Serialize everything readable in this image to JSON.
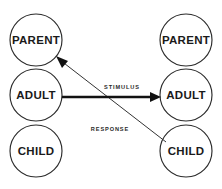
{
  "diagram": {
    "background_color": "#ffffff",
    "line_color": "#111111",
    "circle_stroke_color": "#2b2b2b",
    "text_color": "#1a1a1a",
    "left_column": {
      "name": "left-person",
      "nodes": [
        {
          "id": "left-parent",
          "label": "PARENT",
          "cx": 36,
          "cy": 40,
          "r": 26
        },
        {
          "id": "left-adult",
          "label": "ADULT",
          "cx": 36,
          "cy": 95,
          "r": 26
        },
        {
          "id": "left-child",
          "label": "CHILD",
          "cx": 36,
          "cy": 151,
          "r": 26
        }
      ]
    },
    "right_column": {
      "name": "right-person",
      "nodes": [
        {
          "id": "right-parent",
          "label": "PARENT",
          "cx": 186,
          "cy": 40,
          "r": 26
        },
        {
          "id": "right-adult",
          "label": "ADULT",
          "cx": 186,
          "cy": 95,
          "r": 26
        },
        {
          "id": "right-child",
          "label": "CHILD",
          "cx": 186,
          "cy": 151,
          "r": 26
        }
      ]
    },
    "transactions": [
      {
        "id": "stimulus",
        "label": "STIMULUS",
        "from": "left-adult",
        "to": "right-adult",
        "style": "thick-horizontal",
        "label_x": 122,
        "label_y": 88
      },
      {
        "id": "response",
        "label": "RESPONSE",
        "from": "right-child",
        "to": "left-parent",
        "style": "thin-diagonal",
        "label_x": 110,
        "label_y": 130
      }
    ]
  }
}
